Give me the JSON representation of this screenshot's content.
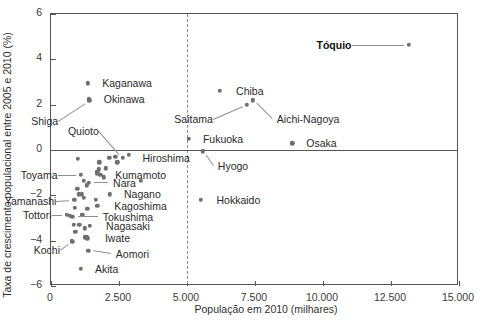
{
  "chart_data": {
    "type": "scatter",
    "title": "",
    "xlabel": "População em 2010 (milhares)",
    "ylabel": "Taxa de crescimento populacional entre 2005 e 2010 (%)",
    "xlim": [
      0,
      15000
    ],
    "ylim": [
      -6,
      6
    ],
    "xticks": [
      0,
      2500,
      5000,
      7500,
      10000,
      12500,
      15000
    ],
    "xticklabels": [
      "0",
      "2.500",
      "5.000",
      "7.500",
      "10.000",
      "12.500",
      "15.000"
    ],
    "yticks": [
      6,
      4,
      2,
      0,
      -2,
      -4,
      -6
    ],
    "yticklabels": [
      "6",
      "4",
      "2",
      "0",
      "−2",
      "−4",
      "−6"
    ],
    "grid": false,
    "legend": false,
    "reference_lines": [
      {
        "axis": "x",
        "value": 5000,
        "style": "dashed"
      },
      {
        "axis": "y",
        "value": 0,
        "style": "solid"
      }
    ],
    "marker_color": "#6f6f6f",
    "points": [
      {
        "label": "Tóquio",
        "x": 13160,
        "y": 4.65,
        "bold": true,
        "label_x": 11050,
        "label_y": 4.65,
        "leader": true
      },
      {
        "label": "Chiba",
        "x": 6216,
        "y": 2.6,
        "label_x": 6620,
        "label_y": 2.6
      },
      {
        "label": "Kaganawa",
        "x": 1360,
        "y": 2.95,
        "label_x": 1700,
        "label_y": 2.95
      },
      {
        "label": "Okinawa",
        "x": 1393,
        "y": 2.25,
        "label_x": 1760,
        "label_y": 2.25
      },
      {
        "label": "Shiga",
        "x": 1410,
        "y": 2.2,
        "label_x": 260,
        "label_y": 1.3,
        "leader": true
      },
      {
        "label": "Saitama",
        "x": 7195,
        "y": 2.0,
        "label_x": 5950,
        "label_y": 1.35,
        "leader": true
      },
      {
        "label": "Aichi-Nagoya",
        "x": 7410,
        "y": 2.2,
        "label_x": 8120,
        "label_y": 1.35,
        "leader": true
      },
      {
        "label": "Osaka",
        "x": 8865,
        "y": 0.3,
        "label_x": 9200,
        "label_y": 0.3
      },
      {
        "label": "Fukuoka",
        "x": 5072,
        "y": 0.5,
        "label_x": 5400,
        "label_y": 0.5
      },
      {
        "label": "Quioto",
        "x": 2636,
        "y": -0.35,
        "label_x": 1760,
        "label_y": 0.85,
        "leader": true
      },
      {
        "label": "Hiroshima",
        "x": 2861,
        "y": -0.2,
        "label_x": 3180,
        "label_y": -0.35
      },
      {
        "label": "Hyogo",
        "x": 5588,
        "y": -0.05,
        "label_x": 5950,
        "label_y": -0.7,
        "leader": true
      },
      {
        "label": "Kumamoto",
        "x": 1817,
        "y": -1.1,
        "label_x": 2180,
        "label_y": -1.1
      },
      {
        "label": "Toyama",
        "x": 1093,
        "y": -1.1,
        "label_x": 240,
        "label_y": -1.1,
        "leader": true
      },
      {
        "label": "Nara",
        "x": 1400,
        "y": -1.45,
        "label_x": 2100,
        "label_y": -1.45,
        "leader": true
      },
      {
        "label": "Nagano",
        "x": 2152,
        "y": -1.95,
        "label_x": 2500,
        "label_y": -1.95
      },
      {
        "label": "Yamanashi",
        "x": 863,
        "y": -2.2,
        "label_x": 200,
        "label_y": -2.25,
        "leader": true
      },
      {
        "label": "Kagoshima",
        "x": 1706,
        "y": -2.45,
        "label_x": 2140,
        "label_y": -2.45
      },
      {
        "label": "Tottori",
        "x": 588,
        "y": -2.85,
        "label_x": 20,
        "label_y": -2.85,
        "leader": true
      },
      {
        "label": "Tokushima",
        "x": 785,
        "y": -2.95,
        "label_x": 1720,
        "label_y": -2.95,
        "leader": true
      },
      {
        "label": "Nagasaki",
        "x": 1426,
        "y": -3.35,
        "label_x": 1840,
        "label_y": -3.35
      },
      {
        "label": "Iwate",
        "x": 1330,
        "y": -3.9,
        "label_x": 1800,
        "label_y": -3.9
      },
      {
        "label": "Kochi",
        "x": 764,
        "y": -4.0,
        "label_x": 330,
        "label_y": -4.4,
        "leader": true
      },
      {
        "label": "Aomori",
        "x": 1373,
        "y": -4.45,
        "label_x": 2200,
        "label_y": -4.6,
        "leader": true
      },
      {
        "label": "Akita",
        "x": 1085,
        "y": -5.25,
        "label_x": 1430,
        "label_y": -5.25
      },
      {
        "label": "Hokkaido",
        "x": 5506,
        "y": -2.2,
        "label_x": 5900,
        "label_y": -2.2
      }
    ],
    "unlabeled_points": [
      {
        "x": 990,
        "y": -0.4
      },
      {
        "x": 1770,
        "y": -0.55
      },
      {
        "x": 2150,
        "y": -0.35
      },
      {
        "x": 2370,
        "y": -0.3
      },
      {
        "x": 2440,
        "y": -0.55
      },
      {
        "x": 1760,
        "y": -0.85
      },
      {
        "x": 1700,
        "y": -0.95
      },
      {
        "x": 1680,
        "y": -1.05
      },
      {
        "x": 2020,
        "y": -0.8
      },
      {
        "x": 1950,
        "y": -1.2
      },
      {
        "x": 3300,
        "y": -1.35
      },
      {
        "x": 1205,
        "y": -1.35
      },
      {
        "x": 1320,
        "y": -1.55
      },
      {
        "x": 960,
        "y": -1.7
      },
      {
        "x": 1020,
        "y": -1.95
      },
      {
        "x": 1130,
        "y": -1.95
      },
      {
        "x": 1215,
        "y": -2.1
      },
      {
        "x": 1640,
        "y": -2.2
      },
      {
        "x": 880,
        "y": -2.55
      },
      {
        "x": 1330,
        "y": -2.6
      },
      {
        "x": 700,
        "y": -2.9
      },
      {
        "x": 1150,
        "y": -2.85
      },
      {
        "x": 830,
        "y": -3.3
      },
      {
        "x": 1045,
        "y": -3.3
      },
      {
        "x": 1245,
        "y": -3.45
      },
      {
        "x": 900,
        "y": -3.6
      },
      {
        "x": 1235,
        "y": -3.85
      },
      {
        "x": 1310,
        "y": -3.85
      },
      {
        "x": 790,
        "y": -4.05
      }
    ]
  }
}
